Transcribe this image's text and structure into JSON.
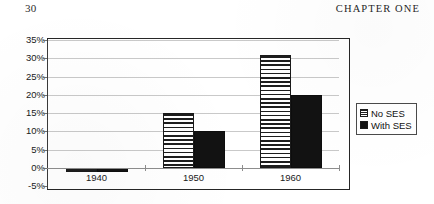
{
  "page": {
    "number": "30",
    "chapter_label": "CHAPTER ONE"
  },
  "chart_data": {
    "type": "bar",
    "title": "",
    "xlabel": "",
    "ylabel": "",
    "categories": [
      "1940",
      "1950",
      "1960"
    ],
    "series": [
      {
        "name": "No SES",
        "values": [
          -1,
          15,
          31
        ],
        "pattern": "horizontal-stripes",
        "color": "#1d1d1d"
      },
      {
        "name": "With SES",
        "values": [
          -1,
          10,
          20
        ],
        "pattern": "solid",
        "color": "#121212"
      }
    ],
    "ylim": [
      -5,
      35
    ],
    "ytick_values": [
      35,
      30,
      25,
      20,
      15,
      10,
      5,
      0,
      -5
    ],
    "ytick_labels": [
      "35%",
      "30%",
      "25%",
      "20%",
      "15%",
      "10%",
      "5%",
      "0%",
      "-5%"
    ],
    "grid": true,
    "legend_position": "right",
    "legend_entries": [
      "No SES",
      "With SES"
    ]
  }
}
